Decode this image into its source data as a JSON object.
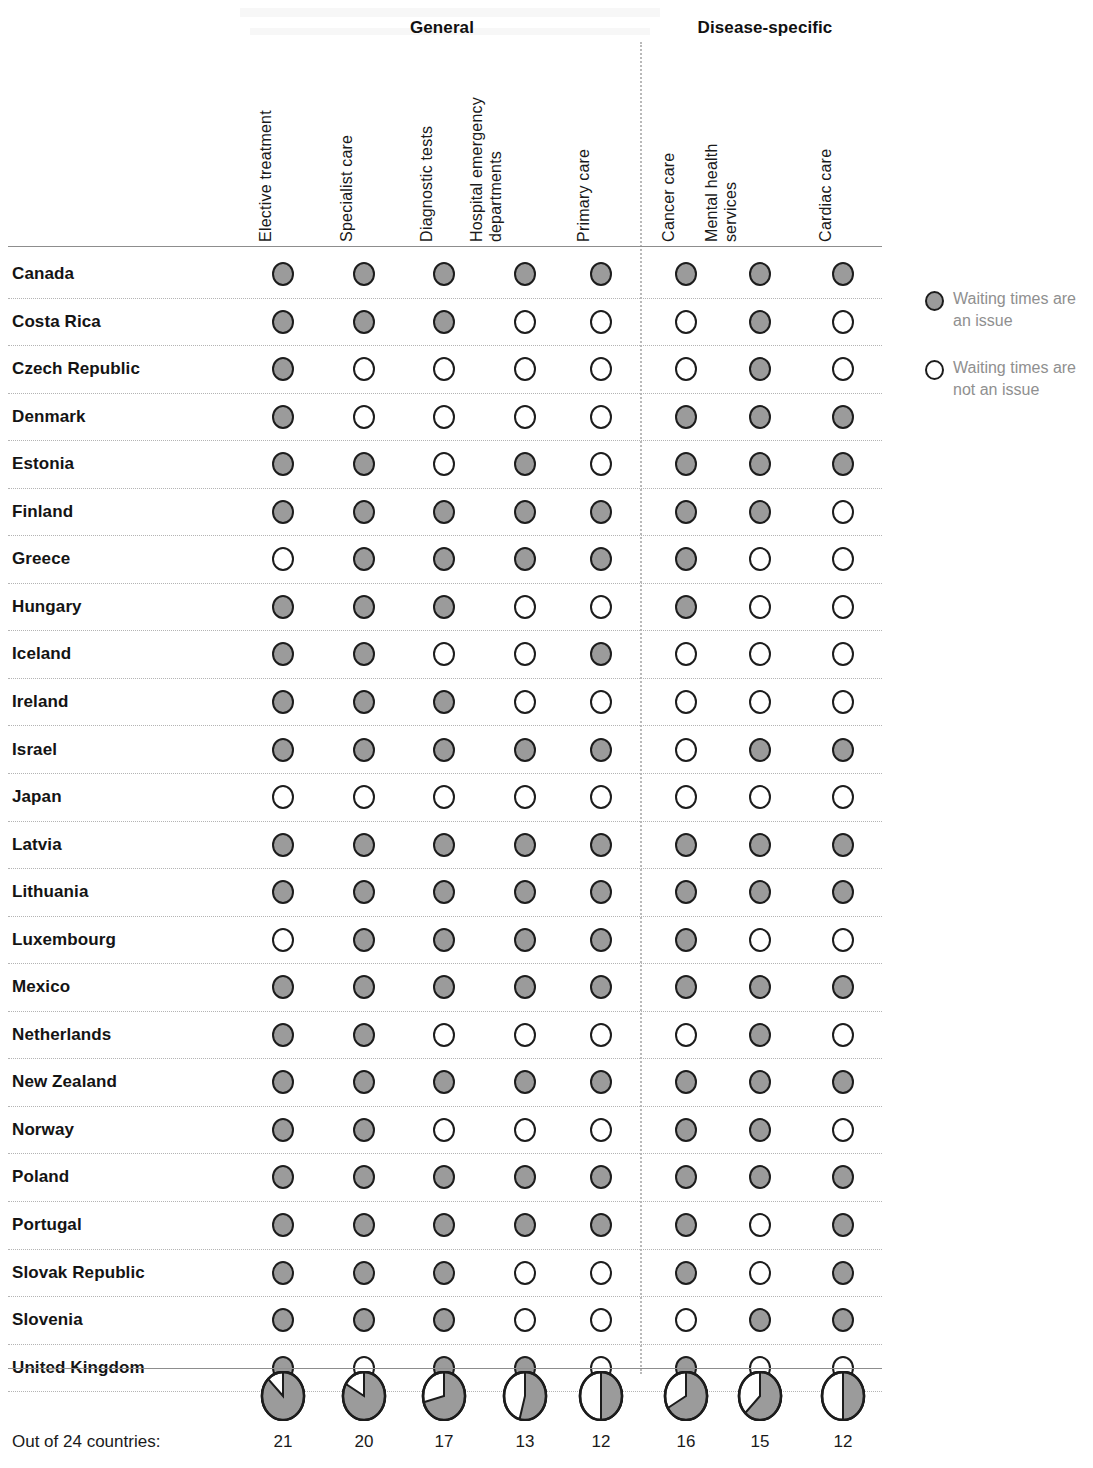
{
  "chart_data": {
    "type": "table",
    "title": "",
    "subtitle": "",
    "legend_position": "right",
    "groups": [
      {
        "label": "General",
        "columns": [
          "Elective treatment",
          "Specialist care",
          "Diagnostic tests",
          "Hospital emergency departments",
          "Primary care"
        ]
      },
      {
        "label": "Disease-specific",
        "columns": [
          "Cancer care",
          "Mental health services",
          "Cardiac care"
        ]
      }
    ],
    "columns": [
      "Elective treatment",
      "Specialist care",
      "Diagnostic tests",
      "Hospital emergency departments",
      "Primary care",
      "Cancer care",
      "Mental health services",
      "Cardiac care"
    ],
    "categories": [
      "Canada",
      "Costa Rica",
      "Czech Republic",
      "Denmark",
      "Estonia",
      "Finland",
      "Greece",
      "Hungary",
      "Iceland",
      "Ireland",
      "Israel",
      "Japan",
      "Latvia",
      "Lithuania",
      "Luxembourg",
      "Mexico",
      "Netherlands",
      "New Zealand",
      "Norway",
      "Poland",
      "Portugal",
      "Slovak Republic",
      "Slovenia",
      "United Kingdom"
    ],
    "value_legend": {
      "1": "Waiting times are an issue",
      "0": "Waiting times are not an issue"
    },
    "rows": [
      {
        "country": "Canada",
        "values": [
          1,
          1,
          1,
          1,
          1,
          1,
          1,
          1
        ]
      },
      {
        "country": "Costa Rica",
        "values": [
          1,
          1,
          1,
          0,
          0,
          0,
          1,
          0
        ]
      },
      {
        "country": "Czech Republic",
        "values": [
          1,
          0,
          0,
          0,
          0,
          0,
          1,
          0
        ]
      },
      {
        "country": "Denmark",
        "values": [
          1,
          0,
          0,
          0,
          0,
          1,
          1,
          1
        ]
      },
      {
        "country": "Estonia",
        "values": [
          1,
          1,
          0,
          1,
          0,
          1,
          1,
          1
        ]
      },
      {
        "country": "Finland",
        "values": [
          1,
          1,
          1,
          1,
          1,
          1,
          1,
          0
        ]
      },
      {
        "country": "Greece",
        "values": [
          0,
          1,
          1,
          1,
          1,
          1,
          0,
          0
        ]
      },
      {
        "country": "Hungary",
        "values": [
          1,
          1,
          1,
          0,
          0,
          1,
          0,
          0
        ]
      },
      {
        "country": "Iceland",
        "values": [
          1,
          1,
          0,
          0,
          1,
          0,
          0,
          0
        ]
      },
      {
        "country": "Ireland",
        "values": [
          1,
          1,
          1,
          0,
          0,
          0,
          0,
          0
        ]
      },
      {
        "country": "Israel",
        "values": [
          1,
          1,
          1,
          1,
          1,
          0,
          1,
          1
        ]
      },
      {
        "country": "Japan",
        "values": [
          0,
          0,
          0,
          0,
          0,
          0,
          0,
          0
        ]
      },
      {
        "country": "Latvia",
        "values": [
          1,
          1,
          1,
          1,
          1,
          1,
          1,
          1
        ]
      },
      {
        "country": "Lithuania",
        "values": [
          1,
          1,
          1,
          1,
          1,
          1,
          1,
          1
        ]
      },
      {
        "country": "Luxembourg",
        "values": [
          0,
          1,
          1,
          1,
          1,
          1,
          0,
          0
        ]
      },
      {
        "country": "Mexico",
        "values": [
          1,
          1,
          1,
          1,
          1,
          1,
          1,
          1
        ]
      },
      {
        "country": "Netherlands",
        "values": [
          1,
          1,
          0,
          0,
          0,
          0,
          1,
          0
        ]
      },
      {
        "country": "New Zealand",
        "values": [
          1,
          1,
          1,
          1,
          1,
          1,
          1,
          1
        ]
      },
      {
        "country": "Norway",
        "values": [
          1,
          1,
          0,
          0,
          0,
          1,
          1,
          0
        ]
      },
      {
        "country": "Poland",
        "values": [
          1,
          1,
          1,
          1,
          1,
          1,
          1,
          1
        ]
      },
      {
        "country": "Portugal",
        "values": [
          1,
          1,
          1,
          1,
          1,
          1,
          0,
          1
        ]
      },
      {
        "country": "Slovak Republic",
        "values": [
          1,
          1,
          1,
          0,
          0,
          1,
          0,
          1
        ]
      },
      {
        "country": "Slovenia",
        "values": [
          1,
          1,
          1,
          0,
          0,
          0,
          1,
          1
        ]
      },
      {
        "country": "United Kingdom",
        "values": [
          1,
          0,
          1,
          1,
          0,
          1,
          0,
          0
        ]
      }
    ],
    "summary_label": "Out of 24 countries:",
    "summary_denominator": 24,
    "summary_totals": [
      21,
      20,
      17,
      13,
      12,
      16,
      15,
      12
    ],
    "pie_fractions": [
      0.875,
      0.8333,
      0.7083,
      0.5417,
      0.5,
      0.6667,
      0.625,
      0.5
    ],
    "colors": {
      "issue_fill": "#9b9b9b",
      "noissue_fill": "#ffffff",
      "outline": "#1c1c1c",
      "legend_text": "#8f8f8f"
    }
  },
  "legend": {
    "items": [
      {
        "marker": "issue",
        "label": "Waiting times are an issue"
      },
      {
        "marker": "noissue",
        "label": "Waiting times are not an issue"
      }
    ]
  }
}
